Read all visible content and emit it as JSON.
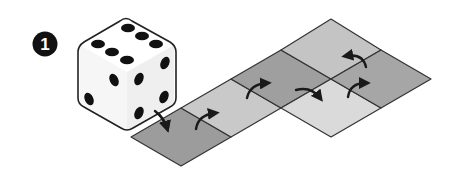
{
  "step": {
    "number": "1",
    "badge_color": "#111111",
    "text_color": "#ffffff"
  },
  "die": {
    "faces_visible": {
      "top": 6,
      "left": 2,
      "right": 4
    },
    "face_color": "#ffffff",
    "pip_color": "#111111",
    "outline_color": "#222222"
  },
  "board": {
    "tiles": [
      {
        "id": "t1",
        "shade": "dark",
        "color": "#9c9c9c"
      },
      {
        "id": "t2",
        "shade": "light",
        "color": "#c9c9c9"
      },
      {
        "id": "t3",
        "shade": "dark",
        "color": "#9f9f9f"
      },
      {
        "id": "t4",
        "shade": "lightest",
        "color": "#dadada"
      },
      {
        "id": "t5",
        "shade": "light",
        "color": "#c4c4c4"
      },
      {
        "id": "t6",
        "shade": "dark",
        "color": "#a6a6a6"
      }
    ],
    "edge_color": "#333333",
    "arrow_color": "#1a1a1a"
  }
}
